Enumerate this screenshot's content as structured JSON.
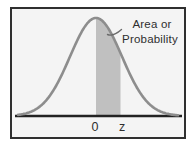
{
  "figure": {
    "annotation": {
      "line1": "Area or",
      "line2": "Probability"
    },
    "colors": {
      "background_outer": "#ffffff",
      "background": "#f4f4f4",
      "frame_border": "#2f2f2f",
      "curve": "#8d8d8d",
      "shade": "#c0c0c0",
      "axis_line": "#222222",
      "leader": "#6a6a6a",
      "text": "#2e2e2e"
    }
  },
  "chart_data": {
    "type": "area",
    "annotation": "Area or Probability",
    "x_tick_labels": [
      "0",
      "z"
    ],
    "shaded_region": {
      "from_label": "0",
      "to_label": "z"
    },
    "ticks": [
      {
        "label": "0",
        "x": 95
      },
      {
        "label": "z",
        "x": 122
      }
    ],
    "geometry": {
      "mean_x": 96,
      "sigma": 26,
      "peak_y": 18,
      "baseline_y": 116,
      "curve_from_x": 18,
      "curve_to_x": 178,
      "shade_from_x": 96,
      "shade_to_x": 120.5,
      "axis_from_x": 15,
      "axis_to_x": 182
    }
  }
}
